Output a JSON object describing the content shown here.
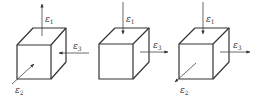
{
  "diagram": {
    "colors": {
      "stroke": "#333333",
      "background": "#ffffff"
    },
    "cubes": [
      {
        "id": "cube-1",
        "labels": {
          "e1": "ε",
          "e1_sub": "1",
          "e2": "ε",
          "e2_sub": "2",
          "e3": "ε",
          "e3_sub": "3"
        },
        "arrows": {
          "e1": "outward-up",
          "e2": "inward",
          "e3": "inward-left"
        }
      },
      {
        "id": "cube-2",
        "labels": {
          "e1": "ε",
          "e1_sub": "1",
          "e3": "ε",
          "e3_sub": "3"
        },
        "arrows": {
          "e1": "inward-down",
          "e3": "outward-right"
        }
      },
      {
        "id": "cube-3",
        "labels": {
          "e1": "ε",
          "e1_sub": "1",
          "e2": "ε",
          "e2_sub": "2",
          "e3": "ε",
          "e3_sub": "3"
        },
        "arrows": {
          "e1": "inward-down",
          "e2": "outward-down-left",
          "e3": "outward-right"
        }
      }
    ]
  }
}
